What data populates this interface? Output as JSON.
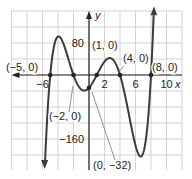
{
  "chart_data": {
    "type": "line",
    "title": "",
    "function": "y = 0.1(x+5)(x+2)(x-1)(x-4)(x-8)",
    "coefficient": 0.1,
    "roots": [
      -5,
      -2,
      1,
      4,
      8
    ],
    "xlabel": "x",
    "ylabel": "y",
    "xlim": [
      -10,
      12
    ],
    "ylim": [
      -240,
      160
    ],
    "x_grid_step": 2,
    "y_grid_step": 40,
    "grid": true,
    "x_tick_labels": [
      {
        "value": -6,
        "text": "−6"
      },
      {
        "value": 2,
        "text": "2"
      },
      {
        "value": 6,
        "text": "6"
      },
      {
        "value": 10,
        "text": "10"
      }
    ],
    "y_tick_labels": [
      {
        "value": 80,
        "text": "80"
      },
      {
        "value": -160,
        "text": "−160"
      }
    ],
    "points": [
      {
        "x": -5,
        "y": 0,
        "text": "(−5, 0)"
      },
      {
        "x": -2,
        "y": 0,
        "text": "(−2, 0)"
      },
      {
        "x": 1,
        "y": 0,
        "text": "(1, 0)"
      },
      {
        "x": 4,
        "y": 0,
        "text": "(4, 0)"
      },
      {
        "x": 8,
        "y": 0,
        "text": "(8, 0)"
      },
      {
        "x": 0,
        "y": -32,
        "text": "(0, −32)"
      }
    ],
    "colors": {
      "curve": "#3a3a3a",
      "axis": "#222222",
      "grid": "#c8c8c8",
      "text": "#222222"
    }
  }
}
